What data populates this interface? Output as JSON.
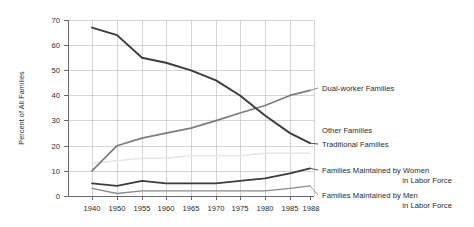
{
  "chart_data": {
    "type": "line",
    "title": "",
    "xlabel": "",
    "ylabel": "Percent of All Families",
    "ylim": [
      0,
      70
    ],
    "yticks": [
      0,
      10,
      20,
      30,
      40,
      50,
      60,
      70
    ],
    "grid": true,
    "legend_position": "inline-right",
    "categories": [
      "1940",
      "1950",
      "1955",
      "1960",
      "1965",
      "1970",
      "1975",
      "1980",
      "1985",
      "1988"
    ],
    "series": [
      {
        "name": "Traditional Families",
        "color": "#3c3c3c",
        "values": [
          67,
          64,
          55,
          53,
          50,
          46,
          40,
          32,
          25,
          21
        ]
      },
      {
        "name": "Dual-worker Families",
        "color": "#7d7d7d",
        "values": [
          10,
          20,
          23,
          25,
          27,
          30,
          33,
          36,
          40,
          42
        ]
      },
      {
        "name": "Other Families",
        "color": "#e6e6e6",
        "values": [
          13,
          14,
          15,
          15,
          16,
          16,
          16,
          17,
          17,
          17
        ]
      },
      {
        "name": "Families Maintained by Women in Labor Force",
        "color": "#3c3c3c",
        "values": [
          5,
          4,
          6,
          5,
          5,
          5,
          6,
          7,
          9,
          11
        ]
      },
      {
        "name": "Families Maintained by Men in Labor Force",
        "color": "#8a8a8a",
        "values": [
          3,
          1,
          2,
          2,
          2,
          2,
          2,
          2,
          3,
          4
        ]
      }
    ],
    "annotations": [
      {
        "text": "Dual-worker Families",
        "anchor_series": "Dual-worker Families",
        "anchor_value": 42
      },
      {
        "text": "Other Families",
        "anchor_series": "Other Families",
        "anchor_value": 17
      },
      {
        "text": "Traditional Families",
        "anchor_series": "Traditional Families",
        "anchor_value": 21
      },
      {
        "text": "Families Maintained by Women",
        "text2": "in Labor Force",
        "anchor_series": "Families Maintained by Women in Labor Force",
        "anchor_value": 11
      },
      {
        "text": "Families Maintained by Men",
        "text2": "in Labor Force",
        "anchor_series": "Families Maintained by Men in Labor Force",
        "anchor_value": 4
      }
    ]
  },
  "axis": {
    "y_title": "Percent of All Families",
    "y_ticks": [
      "70",
      "60",
      "50",
      "40",
      "30",
      "20",
      "10",
      "0"
    ],
    "x_ticks": [
      "1940",
      "1950",
      "1955",
      "1960",
      "1965",
      "1970",
      "1975",
      "1980",
      "1985",
      "1988"
    ]
  },
  "labels": {
    "dual_worker": "Dual-worker Families",
    "other": "Other Families",
    "traditional": "Traditional Families",
    "women_l1": "Families Maintained by Women",
    "women_l2": "in Labor Force",
    "men_l1": "Families Maintained by Men",
    "men_l2": "in Labor Force"
  }
}
